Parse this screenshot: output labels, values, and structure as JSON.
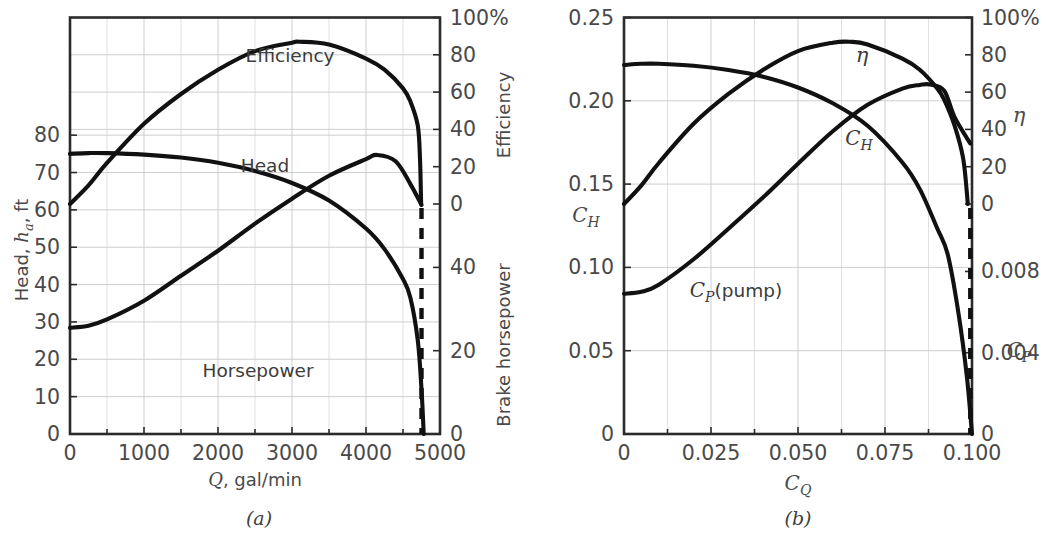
{
  "figure": {
    "caption_a": "(a)",
    "caption_b": "(b)"
  },
  "panel_a": {
    "x_axis": {
      "title_math": "Q",
      "title_rest": ", gal/min",
      "ticks": [
        "0",
        "1000",
        "2000",
        "3000",
        "4000",
        "5000"
      ],
      "tick_values": [
        0,
        1000,
        2000,
        3000,
        4000,
        5000
      ],
      "minor_step": 500,
      "range": [
        0,
        5000
      ]
    },
    "y_left": {
      "title_pre": "Head, ",
      "title_math": "h",
      "title_sub": "a",
      "title_post": ", ft",
      "ticks": [
        "0",
        "10",
        "20",
        "30",
        "40",
        "50",
        "60",
        "70",
        "80"
      ],
      "tick_values": [
        0,
        10,
        20,
        30,
        40,
        50,
        60,
        70,
        80
      ],
      "range": [
        0,
        111.5
      ]
    },
    "y_right_upper": {
      "title": "Efficiency",
      "ticks": [
        "0",
        "20",
        "40",
        "60",
        "80",
        "100%"
      ],
      "tick_values": [
        0,
        20,
        40,
        60,
        80,
        100
      ],
      "range": [
        0,
        100
      ]
    },
    "y_right_lower": {
      "title": "Brake horsepower",
      "ticks": [
        "0",
        "20",
        "40",
        "60",
        "80",
        "100"
      ],
      "tick_values": [
        0,
        20,
        40,
        60,
        80,
        100
      ],
      "range": [
        0,
        100
      ]
    },
    "curve_labels": {
      "efficiency": "Efficiency",
      "head": "Head",
      "horsepower": "Horsepower"
    }
  },
  "panel_b": {
    "x_axis": {
      "title_math": "C",
      "title_sub": "Q",
      "ticks": [
        "0",
        "0.025",
        "0.050",
        "0.075",
        "0.100"
      ],
      "tick_values": [
        0,
        0.025,
        0.05,
        0.075,
        0.1
      ],
      "minor_step": 0.0125,
      "range": [
        0,
        0.1
      ]
    },
    "y_left": {
      "title_math": "C",
      "title_sub": "H",
      "ticks": [
        "0",
        "0.05",
        "0.10",
        "0.15",
        "0.20",
        "0.25"
      ],
      "tick_values": [
        0,
        0.05,
        0.1,
        0.15,
        0.2,
        0.25
      ],
      "range": [
        0,
        0.25
      ]
    },
    "y_right_upper": {
      "title_math": "η",
      "ticks": [
        "0",
        "20",
        "40",
        "60",
        "80",
        "100%"
      ],
      "tick_values": [
        0,
        20,
        40,
        60,
        80,
        100
      ],
      "range": [
        0,
        100
      ]
    },
    "y_right_lower": {
      "title_math": "C",
      "title_sub": "P",
      "ticks": [
        "0",
        "0.004",
        "0.008",
        "0.012",
        "0.016"
      ],
      "tick_values": [
        0,
        0.004,
        0.008,
        0.012,
        0.016
      ],
      "range": [
        0,
        0.0205
      ]
    },
    "curve_labels": {
      "efficiency": "η",
      "head_math": "C",
      "head_sub": "H",
      "power_math": "C",
      "power_sub": "P",
      "power_rest": "(pump)"
    }
  },
  "chart_data": [
    {
      "type": "line",
      "title": "Pump performance curves (dimensional)",
      "xlabel": "Q, gal/min",
      "ylabel": "Head, h_a, ft",
      "xlim": [
        0,
        5000
      ],
      "ylim": [
        0,
        111.5
      ],
      "grid": true,
      "legend": "inline curve labels",
      "cutoff_line_x": 4750,
      "series": [
        {
          "name": "Head",
          "axis": "left",
          "unit": "ft",
          "x": [
            0,
            250,
            500,
            1000,
            1500,
            2000,
            2500,
            3000,
            3500,
            4000,
            4250,
            4500,
            4600,
            4700,
            4750,
            4780
          ],
          "y": [
            75.0,
            75.2,
            75.2,
            74.8,
            74.0,
            72.6,
            70.4,
            67.2,
            62.5,
            55.0,
            49.5,
            41.5,
            36.5,
            25.0,
            12.0,
            0.0
          ]
        },
        {
          "name": "Efficiency",
          "axis": "right-upper",
          "unit": "%",
          "x": [
            0,
            250,
            500,
            1000,
            1500,
            2000,
            2500,
            3000,
            3100,
            3500,
            4000,
            4250,
            4500,
            4600,
            4700,
            4730,
            4745
          ],
          "y": [
            0.0,
            10.0,
            22.0,
            43.0,
            59.0,
            72.0,
            82.0,
            86.5,
            87.0,
            85.5,
            78.0,
            72.0,
            62.0,
            55.0,
            42.0,
            24.0,
            0.0
          ]
        },
        {
          "name": "Horsepower",
          "axis": "right-lower",
          "unit": "bhp",
          "x": [
            0,
            250,
            500,
            1000,
            1500,
            2000,
            2500,
            3000,
            3500,
            4000,
            4150,
            4400,
            4600,
            4750
          ],
          "y": [
            25.5,
            26.0,
            27.5,
            32.0,
            38.0,
            44.0,
            50.5,
            56.5,
            62.0,
            66.0,
            67.0,
            65.5,
            60.0,
            55.0
          ]
        }
      ]
    },
    {
      "type": "line",
      "title": "Pump performance curves (dimensionless)",
      "xlabel": "C_Q",
      "ylabel": "C_H",
      "xlim": [
        0,
        0.1
      ],
      "ylim": [
        0,
        0.25
      ],
      "grid": true,
      "legend": "inline curve labels",
      "cutoff_line_x": 0.0995,
      "series": [
        {
          "name": "C_H",
          "axis": "left",
          "x": [
            0,
            0.005,
            0.01,
            0.02,
            0.03,
            0.04,
            0.05,
            0.06,
            0.07,
            0.08,
            0.085,
            0.09,
            0.093,
            0.096,
            0.0985,
            0.1
          ],
          "y": [
            0.2215,
            0.2222,
            0.2222,
            0.221,
            0.2185,
            0.2145,
            0.208,
            0.1985,
            0.185,
            0.163,
            0.147,
            0.1235,
            0.108,
            0.074,
            0.035,
            0.0
          ]
        },
        {
          "name": "eta",
          "axis": "right-upper",
          "unit": "%",
          "x": [
            0,
            0.005,
            0.01,
            0.02,
            0.03,
            0.04,
            0.05,
            0.06,
            0.065,
            0.07,
            0.08,
            0.085,
            0.09,
            0.092,
            0.095,
            0.0975,
            0.0988
          ],
          "y": [
            0.0,
            10.0,
            22.0,
            43.0,
            59.0,
            72.0,
            82.0,
            86.5,
            87.0,
            85.5,
            78.0,
            72.0,
            62.0,
            56.0,
            42.0,
            24.0,
            0.0
          ]
        },
        {
          "name": "C_P (pump)",
          "axis": "right-lower",
          "x": [
            0,
            0.005,
            0.01,
            0.02,
            0.03,
            0.04,
            0.05,
            0.06,
            0.07,
            0.08,
            0.085,
            0.088,
            0.092,
            0.095,
            0.0995
          ],
          "y": [
            0.0069,
            0.007,
            0.00735,
            0.0086,
            0.0101,
            0.01165,
            0.0133,
            0.0149,
            0.0162,
            0.017,
            0.01718,
            0.0172,
            0.0169,
            0.0156,
            0.0143
          ]
        }
      ]
    }
  ]
}
